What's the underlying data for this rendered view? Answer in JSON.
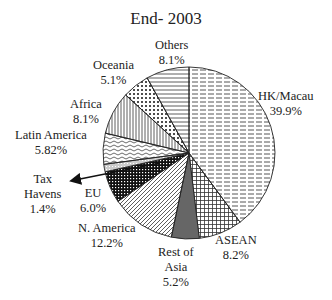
{
  "chart_data": {
    "type": "pie",
    "title": "End- 2003",
    "start_angle_deg": 0,
    "direction": "clockwise",
    "slices": [
      {
        "label": "HK/Macau",
        "value": 39.9,
        "display": "39.9%",
        "pattern": "dashed-horizontal"
      },
      {
        "label": "ASEAN",
        "value": 8.2,
        "display": "8.2%",
        "pattern": "grid"
      },
      {
        "label": "Rest of Asia",
        "value": 5.2,
        "display": "5.2%",
        "pattern": "solid-gray"
      },
      {
        "label": "N. America",
        "value": 12.2,
        "display": "12.2%",
        "pattern": "diagonal"
      },
      {
        "label": "EU",
        "value": 6.0,
        "display": "6.0%",
        "pattern": "dense-grid"
      },
      {
        "label": "Tax Havens",
        "value": 1.4,
        "display": "1.4%",
        "pattern": "dotted-line"
      },
      {
        "label": "Latin America",
        "value": 5.82,
        "display": "5.82%",
        "pattern": "wave"
      },
      {
        "label": "Africa",
        "value": 8.1,
        "display": "8.1%",
        "pattern": "vertical"
      },
      {
        "label": "Oceania",
        "value": 5.1,
        "display": "5.1%",
        "pattern": "dots"
      },
      {
        "label": "Others",
        "value": 8.1,
        "display": "8.1%",
        "pattern": "horizontal"
      }
    ],
    "annotations": [
      {
        "text": "arrow pointing from Tax Havens slice to its label"
      }
    ],
    "legend": "none (direct labels)"
  },
  "labels": {
    "hk_name": "HK/Macau",
    "hk_val": "39.9%",
    "asean_name": "ASEAN",
    "asean_val": "8.2%",
    "roa_name1": "Rest of",
    "roa_name2": "Asia",
    "roa_val": "5.2%",
    "na_name": "N. America",
    "na_val": "12.2%",
    "eu_name": "EU",
    "eu_val": "6.0%",
    "th_name1": "Tax",
    "th_name2": "Havens",
    "th_val": "1.4%",
    "la_name": "Latin America",
    "la_val": "5.82%",
    "af_name": "Africa",
    "af_val": "8.1%",
    "oc_name": "Oceania",
    "oc_val": "5.1%",
    "ot_name": "Others",
    "ot_val": "8.1%"
  }
}
